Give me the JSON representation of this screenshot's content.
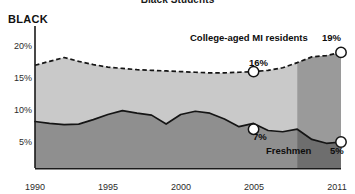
{
  "chart_data": {
    "type": "area",
    "title": "Black Students",
    "group_label": "BLACK",
    "xlabel": "",
    "ylabel": "",
    "xlim": [
      1990,
      2011
    ],
    "ylim": [
      0,
      22
    ],
    "grid": false,
    "legend_position": "inline-annotations",
    "x_ticks": [
      1990,
      1995,
      2000,
      2005,
      2011
    ],
    "x_tick_labels": [
      "1990",
      "1995",
      "2000",
      "2005",
      "2011"
    ],
    "y_ticks": [
      5,
      10,
      15,
      20
    ],
    "y_tick_labels": [
      "5%",
      "10%",
      "15%",
      "20%"
    ],
    "x": [
      1990,
      1991,
      1992,
      1993,
      1994,
      1995,
      1996,
      1997,
      1998,
      1999,
      2000,
      2001,
      2002,
      2003,
      2004,
      2005,
      2006,
      2007,
      2008,
      2009,
      2010,
      2011
    ],
    "series": [
      {
        "name": "College-aged MI residents",
        "style": "dashed",
        "values": [
          17.0,
          17.6,
          18.2,
          17.6,
          17.1,
          16.7,
          16.5,
          16.3,
          16.2,
          16.1,
          16.0,
          15.9,
          15.8,
          15.8,
          15.9,
          16.0,
          16.2,
          16.6,
          17.4,
          18.3,
          18.5,
          19.0
        ]
      },
      {
        "name": "Freshmen",
        "style": "solid",
        "values": [
          8.2,
          7.9,
          7.7,
          7.8,
          8.5,
          9.3,
          9.9,
          9.5,
          9.2,
          7.8,
          9.3,
          9.8,
          9.5,
          8.6,
          7.4,
          7.9,
          6.8,
          6.6,
          7.0,
          5.4,
          4.8,
          5.0
        ]
      }
    ],
    "markers": [
      {
        "series": "College-aged MI residents",
        "x": 2005,
        "y": 16,
        "label": "16%"
      },
      {
        "series": "College-aged MI residents",
        "x": 2011,
        "y": 19,
        "label": "19%"
      },
      {
        "series": "Freshmen",
        "x": 2005,
        "y": 7,
        "label": "7%"
      },
      {
        "series": "Freshmen",
        "x": 2011,
        "y": 5,
        "label": "5%"
      }
    ],
    "highlight_band": {
      "from": 2008,
      "to": 2011
    },
    "colors": {
      "band_upper_fill": "#c9c9c9",
      "band_lower_fill": "#8f8f8f",
      "highlight_overlay": "#6e6e6e",
      "line": "#151515",
      "marker_fill": "#ffffff",
      "axis": "#1a1a1a",
      "text": "#1a1a1a"
    }
  },
  "annotations": {
    "upper_series_label": "College-aged MI residents",
    "upper_end_label": "19%",
    "upper_mid_label": "16%",
    "lower_series_label": "Freshmen",
    "lower_mid_label": "7%",
    "lower_end_label": "5%"
  }
}
